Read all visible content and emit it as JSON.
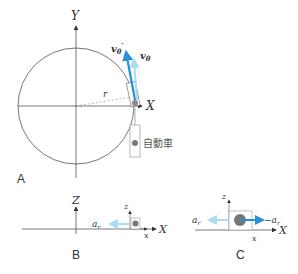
{
  "panels": {
    "A": {
      "label": "A",
      "axis_x": "X",
      "axis_y": "Y",
      "radius_label": "r",
      "vector_dark": "v",
      "vector_dark_sub": "θ",
      "vector_dark_prime": "′",
      "vector_light": "v",
      "vector_light_sub": "θ",
      "car_label": "自動車"
    },
    "B": {
      "label": "B",
      "axis_Z": "Z",
      "axis_X": "X",
      "axis_z": "z",
      "axis_x": "x",
      "accel_label": "a",
      "accel_sub": "r"
    },
    "C": {
      "label": "C",
      "axis_X": "X",
      "axis_z": "z",
      "axis_x": "x",
      "accel_left": "a",
      "accel_left_sub": "r",
      "accel_right": "−a",
      "accel_right_sub": "r"
    }
  },
  "colors": {
    "dark_blue": "#2a8fd6",
    "light_blue": "#a8dcee",
    "line": "#555555",
    "dot": "#777777"
  }
}
